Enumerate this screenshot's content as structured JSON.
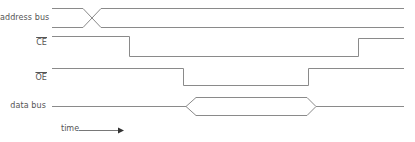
{
  "diagram": {
    "signals": [
      {
        "id": "address_bus",
        "label": "address bus",
        "active_low": false,
        "type": "bus"
      },
      {
        "id": "ce",
        "label": "CE",
        "active_low": true,
        "type": "logic"
      },
      {
        "id": "oe",
        "label": "OE",
        "active_low": true,
        "type": "logic"
      },
      {
        "id": "data_bus",
        "label": "data bus",
        "active_low": false,
        "type": "bus"
      }
    ],
    "time_axis": {
      "label": "time",
      "direction": "right"
    },
    "colors": {
      "waveform": "#8a8a8a",
      "label_text": "#555555",
      "arrow": "#333333",
      "background": "#ffffff"
    }
  }
}
